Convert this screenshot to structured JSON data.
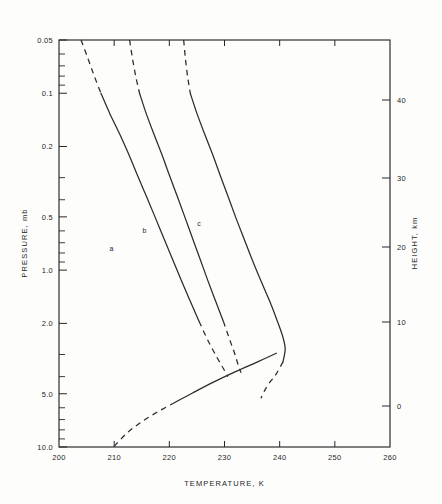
{
  "chart_data": {
    "type": "line",
    "title": "",
    "xlabel": "TEMPERATURE, K",
    "ylabel": "PRESSURE, mb",
    "y2label": "HEIGHT, km",
    "xlim": [
      200,
      260
    ],
    "xticks": [
      200,
      210,
      220,
      230,
      240,
      250,
      260
    ],
    "xtick_labels": [
      "200",
      "210",
      "220",
      "230",
      "240",
      "250",
      "260"
    ],
    "yscale": "log-inverted",
    "ylim": [
      0.05,
      10.0
    ],
    "yticks": [
      0.05,
      0.1,
      0.2,
      0.5,
      1.0,
      2.0,
      5.0,
      10.0
    ],
    "ytick_labels": [
      "0.05",
      "0.1",
      "0.2",
      "0.5",
      "1.0",
      "2.0",
      "5.0",
      "10.0"
    ],
    "y2ticks": [
      0,
      10,
      20,
      30,
      40
    ],
    "y2tick_labels": [
      "0",
      "10",
      "20",
      "30",
      "40"
    ],
    "grid": false,
    "legend": "inline-curve-labels",
    "series": [
      {
        "name": "a",
        "label": "a",
        "label_position": {
          "t": 209.5,
          "p": 0.78
        },
        "dashed_head": true,
        "dashed_tail": true,
        "points": [
          {
            "t": 204.0,
            "p": 0.05
          },
          {
            "t": 205.2,
            "p": 0.063
          },
          {
            "t": 206.4,
            "p": 0.08
          },
          {
            "t": 207.6,
            "p": 0.1
          },
          {
            "t": 209.2,
            "p": 0.13
          },
          {
            "t": 211.0,
            "p": 0.17
          },
          {
            "t": 212.6,
            "p": 0.22
          },
          {
            "t": 214.2,
            "p": 0.29
          },
          {
            "t": 215.8,
            "p": 0.38
          },
          {
            "t": 217.4,
            "p": 0.5
          },
          {
            "t": 219.0,
            "p": 0.66
          },
          {
            "t": 220.6,
            "p": 0.87
          },
          {
            "t": 222.2,
            "p": 1.15
          },
          {
            "t": 223.8,
            "p": 1.5
          },
          {
            "t": 225.4,
            "p": 1.95
          },
          {
            "t": 227.0,
            "p": 2.5
          },
          {
            "t": 228.6,
            "p": 3.1
          },
          {
            "t": 229.8,
            "p": 3.6
          },
          {
            "t": 230.6,
            "p": 4.0
          }
        ]
      },
      {
        "name": "b",
        "label": "b",
        "label_position": {
          "t": 215.5,
          "p": 0.62
        },
        "dashed_head": true,
        "dashed_tail": true,
        "points": [
          {
            "t": 212.8,
            "p": 0.05
          },
          {
            "t": 213.3,
            "p": 0.063
          },
          {
            "t": 213.9,
            "p": 0.08
          },
          {
            "t": 214.6,
            "p": 0.1
          },
          {
            "t": 215.8,
            "p": 0.13
          },
          {
            "t": 217.2,
            "p": 0.17
          },
          {
            "t": 218.6,
            "p": 0.22
          },
          {
            "t": 220.0,
            "p": 0.29
          },
          {
            "t": 221.4,
            "p": 0.38
          },
          {
            "t": 222.8,
            "p": 0.5
          },
          {
            "t": 224.2,
            "p": 0.66
          },
          {
            "t": 225.6,
            "p": 0.87
          },
          {
            "t": 227.0,
            "p": 1.15
          },
          {
            "t": 228.4,
            "p": 1.5
          },
          {
            "t": 229.8,
            "p": 1.95
          },
          {
            "t": 231.0,
            "p": 2.5
          },
          {
            "t": 231.9,
            "p": 3.0
          },
          {
            "t": 232.5,
            "p": 3.45
          },
          {
            "t": 233.0,
            "p": 3.8
          }
        ]
      },
      {
        "name": "c",
        "label": "c",
        "label_position": {
          "t": 225.4,
          "p": 0.56
        },
        "dashed_head": true,
        "dashed_tail": true,
        "points": [
          {
            "t": 222.6,
            "p": 0.05
          },
          {
            "t": 222.9,
            "p": 0.063
          },
          {
            "t": 223.3,
            "p": 0.08
          },
          {
            "t": 223.8,
            "p": 0.1
          },
          {
            "t": 225.0,
            "p": 0.13
          },
          {
            "t": 226.4,
            "p": 0.17
          },
          {
            "t": 227.8,
            "p": 0.22
          },
          {
            "t": 229.2,
            "p": 0.29
          },
          {
            "t": 230.6,
            "p": 0.38
          },
          {
            "t": 232.0,
            "p": 0.5
          },
          {
            "t": 233.5,
            "p": 0.66
          },
          {
            "t": 235.0,
            "p": 0.87
          },
          {
            "t": 236.6,
            "p": 1.15
          },
          {
            "t": 238.2,
            "p": 1.5
          },
          {
            "t": 239.6,
            "p": 1.95
          },
          {
            "t": 240.6,
            "p": 2.4
          },
          {
            "t": 241.0,
            "p": 2.8
          },
          {
            "t": 240.6,
            "p": 3.3
          },
          {
            "t": 239.3,
            "p": 3.9
          },
          {
            "t": 238.0,
            "p": 4.4
          },
          {
            "t": 237.2,
            "p": 4.85
          },
          {
            "t": 236.6,
            "p": 5.3
          }
        ]
      },
      {
        "name": "lower-troposphere-lapse",
        "label": "",
        "dashed_head": false,
        "dashed_tail": true,
        "points": [
          {
            "t": 239.4,
            "p": 2.95
          },
          {
            "t": 236.0,
            "p": 3.3
          },
          {
            "t": 232.0,
            "p": 3.75
          },
          {
            "t": 228.0,
            "p": 4.3
          },
          {
            "t": 224.2,
            "p": 4.95
          },
          {
            "t": 221.0,
            "p": 5.6
          },
          {
            "t": 218.0,
            "p": 6.3
          },
          {
            "t": 215.0,
            "p": 7.2
          },
          {
            "t": 212.4,
            "p": 8.3
          },
          {
            "t": 210.0,
            "p": 9.9
          }
        ]
      }
    ]
  }
}
